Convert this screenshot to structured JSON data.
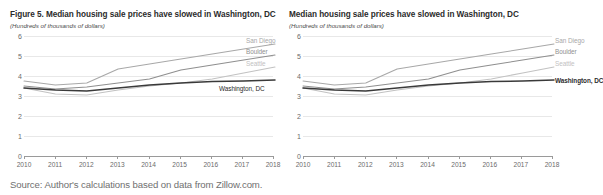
{
  "source_note": "Source: Author's calculations based on data from Zillow.com.",
  "panels": [
    {
      "title": "Figure 5. Median housing sale prices have slowed in Washington, DC",
      "subtitle": "(Hundreds of thousands of dollars)"
    },
    {
      "title": "Median housing sale prices have slowed in Washington, DC",
      "subtitle": "(Hundreds of thousands of dollars)"
    }
  ],
  "chart_data": {
    "type": "line",
    "title": "Median housing sale prices have slowed in Washington, DC",
    "subtitle": "(Hundreds of thousands of dollars)",
    "xlabel": "",
    "ylabel": "Hundreds of thousands of dollars",
    "xlim": [
      2010,
      2018
    ],
    "ylim": [
      0,
      6
    ],
    "yticks": [
      0,
      1,
      2,
      3,
      4,
      5,
      6
    ],
    "xticks": [
      2010,
      2011,
      2012,
      2013,
      2014,
      2015,
      2016,
      2017,
      2018
    ],
    "x": [
      2010,
      2011,
      2012,
      2013,
      2014,
      2015,
      2016,
      2017,
      2018
    ],
    "grid": true,
    "legend": "inline-right-end-labels",
    "series": [
      {
        "name": "San Diego",
        "color": "#a8a8a8",
        "values": [
          3.75,
          3.55,
          3.65,
          4.35,
          4.6,
          4.85,
          5.1,
          5.35,
          5.6
        ]
      },
      {
        "name": "Boulder",
        "color": "#8f8f8f",
        "values": [
          3.5,
          3.35,
          3.45,
          3.65,
          3.85,
          4.3,
          4.55,
          4.8,
          5.05
        ]
      },
      {
        "name": "Seattle",
        "color": "#c2c2c2",
        "values": [
          3.4,
          3.1,
          3.05,
          3.3,
          3.5,
          3.65,
          3.85,
          4.15,
          4.45
        ]
      },
      {
        "name": "Washington, DC",
        "color": "#3a3a3a",
        "values": [
          3.4,
          3.3,
          3.25,
          3.4,
          3.55,
          3.65,
          3.72,
          3.75,
          3.8
        ]
      }
    ]
  }
}
